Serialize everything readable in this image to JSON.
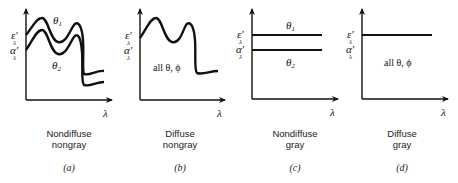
{
  "axis_labels": {
    "x": "λ",
    "emissivity": "ε′",
    "absorptivity": "α′",
    "subscript": "λ"
  },
  "panels": [
    {
      "id": "a",
      "label": "(a)",
      "caption_line1": "Nondiffuse",
      "caption_line2": "nongray",
      "curve_labels": [
        "θ1",
        "θ2"
      ],
      "theta1": "θ",
      "theta1_sub": "1",
      "theta2": "θ",
      "theta2_sub": "2"
    },
    {
      "id": "b",
      "label": "(b)",
      "caption_line1": "Diffuse",
      "caption_line2": "nongray",
      "note": "all θ, ϕ"
    },
    {
      "id": "c",
      "label": "(c)",
      "caption_line1": "Nondiffuse",
      "caption_line2": "gray",
      "theta1": "θ",
      "theta1_sub": "1",
      "theta2": "θ",
      "theta2_sub": "2"
    },
    {
      "id": "d",
      "label": "(d)",
      "caption_line1": "Diffuse",
      "caption_line2": "gray",
      "note": "all θ, ϕ"
    }
  ]
}
